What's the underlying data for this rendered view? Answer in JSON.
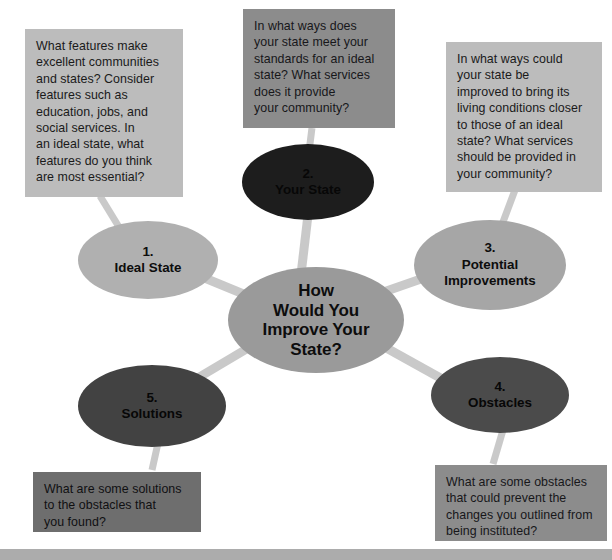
{
  "diagram": {
    "type": "bubble-map",
    "center": {
      "id": "center",
      "label": "How\nWould You\nImprove Your\nState?",
      "color": "#9a9a9a",
      "text_color": "#0d0d0d"
    },
    "nodes": [
      {
        "id": "node-1",
        "number": "1.",
        "title": "Ideal State",
        "label": "1.\nIdeal State",
        "color": "#b0b0b0",
        "text_color": "#0d0d0d"
      },
      {
        "id": "node-2",
        "number": "2.",
        "title": "Your State",
        "label": "2.\nYour State",
        "color": "#1d1d1d",
        "text_color": "#070707"
      },
      {
        "id": "node-3",
        "number": "3.",
        "title": "Potential Improvements",
        "label": "3.\nPotential\nImprovements",
        "color": "#a6a6a6",
        "text_color": "#0d0d0d"
      },
      {
        "id": "node-4",
        "number": "4.",
        "title": "Obstacles",
        "label": "4.\nObstacles",
        "color": "#4b4b4b",
        "text_color": "#070707"
      },
      {
        "id": "node-5",
        "number": "5.",
        "title": "Solutions",
        "label": "5.\nSolutions",
        "color": "#424242",
        "text_color": "#070707"
      }
    ],
    "notes": [
      {
        "id": "note-1",
        "for_node": "node-1",
        "text": "What features make\nexcellent communities\nand states? Consider\nfeatures such as\neducation, jobs, and\nsocial services. In\nan ideal state, what\nfeatures do you think\nare most essential?",
        "color": "#bcbcbc"
      },
      {
        "id": "note-2",
        "for_node": "node-2",
        "text": "In what ways does\nyour state meet your\nstandards for an ideal\nstate? What services\ndoes it provide\nyour community?",
        "color": "#8c8c8c"
      },
      {
        "id": "note-3",
        "for_node": "node-3",
        "text": "In what ways could\nyour state be\nimproved to bring its\nliving conditions closer\nto those of an ideal\nstate? What services\nshould be provided in\nyour community?",
        "color": "#bcbcbc"
      },
      {
        "id": "note-4",
        "for_node": "node-4",
        "text": "What are some obstacles\nthat could prevent the\nchanges you outlined from\nbeing instituted?",
        "color": "#8c8c8c"
      },
      {
        "id": "note-5",
        "for_node": "node-5",
        "text": "What are some solutions\nto the obstacles that\nyou found?",
        "color": "#6e6e6e"
      }
    ],
    "connector_color": "#c9c9c9",
    "background_color": "#ffffff",
    "footer_bar_color": "#acacac"
  }
}
